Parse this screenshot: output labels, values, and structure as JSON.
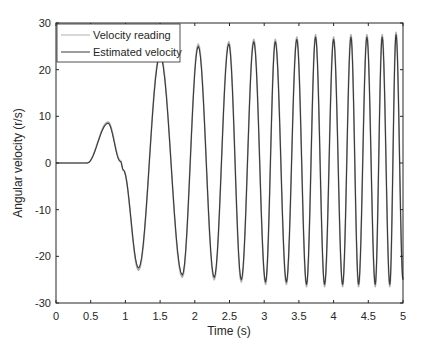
{
  "chart_data": {
    "type": "line",
    "title": "",
    "xlabel": "Time (s)",
    "ylabel": "Angular velocity (r/s)",
    "xlim": [
      0,
      5
    ],
    "ylim": [
      -30,
      30
    ],
    "xticks": [
      "0",
      "0.5",
      "1",
      "1.5",
      "2",
      "2.5",
      "3",
      "3.5",
      "4",
      "4.5",
      "5"
    ],
    "yticks": [
      "30",
      "20",
      "10",
      "0",
      "-10",
      "-20",
      "-30"
    ],
    "grid": false,
    "legend_position": "upper left",
    "series": [
      {
        "name": "Velocity reading",
        "color": "#b0b0b0",
        "key_points": [
          [
            0,
            0
          ],
          [
            0.45,
            0
          ],
          [
            0.75,
            8.8
          ],
          [
            0.93,
            0.5
          ],
          [
            0.97,
            -1.5
          ],
          [
            1.19,
            -23
          ],
          [
            1.5,
            23.5
          ],
          [
            1.82,
            -24.5
          ],
          [
            2.05,
            25.5
          ],
          [
            2.28,
            -25
          ],
          [
            2.49,
            26
          ],
          [
            2.67,
            -25.5
          ],
          [
            2.85,
            26.5
          ],
          [
            3.02,
            -26
          ],
          [
            3.16,
            26.5
          ],
          [
            3.32,
            -26
          ],
          [
            3.47,
            27
          ],
          [
            3.61,
            -26.5
          ],
          [
            3.74,
            27.5
          ],
          [
            3.87,
            -26.5
          ],
          [
            4.0,
            27
          ],
          [
            4.13,
            -26.5
          ],
          [
            4.25,
            27.5
          ],
          [
            4.36,
            -26.5
          ],
          [
            4.48,
            27.5
          ],
          [
            4.6,
            -26.5
          ],
          [
            4.7,
            27.5
          ],
          [
            4.81,
            -26.5
          ],
          [
            4.9,
            28
          ],
          [
            5.0,
            -25
          ]
        ]
      },
      {
        "name": "Estimated velocity",
        "color": "#3a3a3a",
        "key_points": [
          [
            0,
            0
          ],
          [
            0.45,
            0
          ],
          [
            0.75,
            8.5
          ],
          [
            0.93,
            0.3
          ],
          [
            0.97,
            -1.5
          ],
          [
            1.19,
            -22.5
          ],
          [
            1.5,
            23
          ],
          [
            1.82,
            -24
          ],
          [
            2.05,
            25
          ],
          [
            2.28,
            -24.5
          ],
          [
            2.49,
            25.5
          ],
          [
            2.67,
            -25
          ],
          [
            2.85,
            26
          ],
          [
            3.02,
            -25.5
          ],
          [
            3.16,
            26
          ],
          [
            3.32,
            -25.5
          ],
          [
            3.47,
            26.5
          ],
          [
            3.61,
            -26
          ],
          [
            3.74,
            27
          ],
          [
            3.87,
            -26
          ],
          [
            4.0,
            26.5
          ],
          [
            4.13,
            -26
          ],
          [
            4.25,
            27
          ],
          [
            4.36,
            -26
          ],
          [
            4.48,
            27
          ],
          [
            4.6,
            -26
          ],
          [
            4.7,
            27
          ],
          [
            4.81,
            -26
          ],
          [
            4.9,
            27.5
          ],
          [
            5.0,
            -25
          ]
        ]
      }
    ]
  },
  "legend": {
    "items": [
      "Velocity reading",
      "Estimated velocity"
    ]
  }
}
